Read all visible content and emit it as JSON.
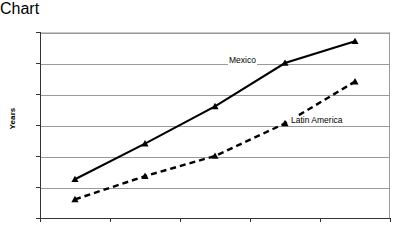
{
  "chart_data": {
    "type": "line",
    "title": "",
    "xlabel": "",
    "ylabel": "Years",
    "categories": [
      "1980",
      "1985",
      "1990",
      "2000",
      "2005"
    ],
    "ylim": [
      64,
      76
    ],
    "yticks": [
      64,
      66,
      68,
      70,
      72,
      74,
      76
    ],
    "grid": true,
    "legend_position": "inline-annotations",
    "series": [
      {
        "name": "Mexico",
        "values": [
          66.5,
          68.8,
          71.2,
          74.0,
          75.4
        ],
        "style": "solid",
        "marker": "triangle",
        "color": "#000000"
      },
      {
        "name": "Latin America",
        "values": [
          65.2,
          66.7,
          68.0,
          70.1,
          72.8
        ],
        "style": "dashed",
        "marker": "triangle",
        "color": "#000000"
      }
    ],
    "annotations": [
      {
        "text": "Mexico",
        "series": "Mexico"
      },
      {
        "text": "Latin America",
        "series": "Latin America"
      }
    ]
  },
  "axis": {
    "y_title": "Years",
    "y_tick_labels": [
      "76",
      "74",
      "72",
      "70",
      "68",
      "66",
      "64"
    ],
    "x_tick_labels": [
      "1980",
      "1985",
      "1990",
      "2000",
      "2005"
    ]
  },
  "colors": {
    "gridline": "#9a9a9a",
    "axis": "#333333",
    "series": "#000000",
    "background": "#ffffff"
  }
}
